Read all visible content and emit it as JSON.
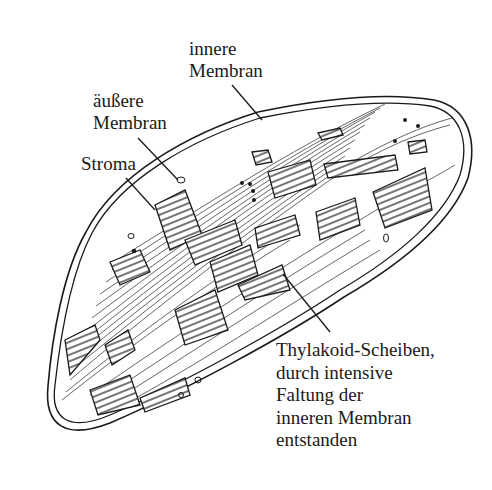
{
  "diagram": {
    "labels": {
      "inner_membrane": {
        "lines": [
          "innere",
          "Membran"
        ]
      },
      "outer_membrane": {
        "lines": [
          "äußere",
          "Membran"
        ]
      },
      "stroma": {
        "lines": [
          "Stroma"
        ]
      },
      "thylakoid": {
        "lines": [
          "Thylakoid-Scheiben,",
          "durch intensive",
          "Faltung der",
          "inneren Membran",
          "entstanden"
        ]
      }
    },
    "colors": {
      "ink": "#1a1a1a",
      "lamella": "#555555",
      "background": "#ffffff"
    }
  }
}
